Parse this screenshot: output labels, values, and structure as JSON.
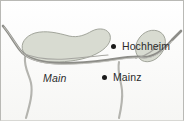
{
  "figure": {
    "kind": "regional-map",
    "width": 184,
    "height": 121,
    "background_color": "#fdfdfc",
    "frame_color": "#b9b9b5"
  },
  "map": {
    "labels": {
      "hochheim": "Hochheim",
      "mainz": "Mainz",
      "main": "Main"
    },
    "markers": [
      {
        "name": "hochheim",
        "label": "Hochheim",
        "x": 113,
        "y": 46
      },
      {
        "name": "mainz",
        "label": "Mainz",
        "x": 104,
        "y": 77
      }
    ],
    "regions": [
      {
        "name": "left-shaded-area",
        "fill": "#d8dbd1"
      },
      {
        "name": "right-shaded-area",
        "fill": "#d8dbd1"
      }
    ],
    "rivers": [
      {
        "name": "rhine-main-channel",
        "stroke": "#8d8d88"
      },
      {
        "name": "left-tributary",
        "stroke": "#b0b0ab"
      },
      {
        "name": "right-tributary",
        "stroke": "#b0b0ab"
      }
    ],
    "colors": {
      "region_fill": "#d8dbd1",
      "region_stroke": "#9a9d93",
      "river_stroke": "#8d8d88",
      "marker_fill": "#1a1a1a",
      "text": "#2b2b2b"
    }
  }
}
